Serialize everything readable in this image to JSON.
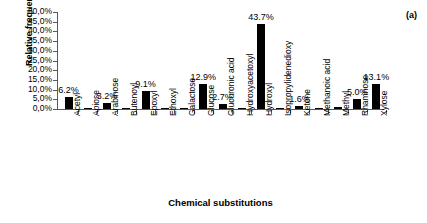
{
  "panel": {
    "label": "(a)"
  },
  "chart_data": {
    "type": "bar",
    "title": "",
    "xlabel": "Chemical substitutions",
    "ylabel": "Relative frequencies (%)",
    "ylim": [
      0,
      50
    ],
    "ytick_labels": [
      "50,0%",
      "45,0%",
      "40,0%",
      "35,0%",
      "30,0%",
      "25,0%",
      "20,0%",
      "15,0%",
      "10,0%",
      "5,0%",
      "0,0%"
    ],
    "ytick_values": [
      50,
      45,
      40,
      35,
      30,
      25,
      20,
      15,
      10,
      5,
      0
    ],
    "grid": false,
    "legend": false,
    "bar_color": "#000000",
    "categories": [
      "Acetyl",
      "Apiose",
      "Arabinose",
      "Butenoyl",
      "Epoxyl",
      "Ethoxyl",
      "Galactose",
      "Glucose",
      "Glucuronic acid",
      "Hydroxyacetoxyl",
      "Hydroxyl",
      "Isopropylidenedioxy",
      "Ketone",
      "Methanoic acid",
      "Methyl",
      "Rhamnose",
      "Xylose"
    ],
    "values": [
      6.2,
      0.1,
      3.2,
      0.1,
      9.1,
      0.1,
      0.1,
      12.9,
      2.7,
      0.1,
      43.7,
      0.1,
      1.6,
      0.1,
      0.8,
      5.0,
      13.1
    ],
    "data_labels": [
      "6.2%",
      "",
      "3.2%",
      "",
      "9.1%",
      "",
      "",
      "12.9%",
      "2.7%",
      "",
      "43.7%",
      "",
      "1.6%",
      "",
      "",
      "5.0%",
      "13.1%"
    ]
  }
}
